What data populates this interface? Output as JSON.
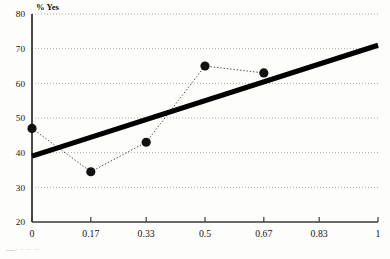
{
  "chart_data": {
    "type": "line",
    "title": "",
    "subtitle": "",
    "xlabel": "",
    "ylabel": "% Yes",
    "x": [
      0,
      0.17,
      0.33,
      0.5,
      0.67
    ],
    "values": [
      47,
      34.5,
      43,
      65,
      63
    ],
    "series": [
      {
        "name": "% Yes observed",
        "x": [
          0,
          0.17,
          0.33,
          0.5,
          0.67
        ],
        "values": [
          47,
          34.5,
          43,
          65,
          63
        ],
        "marker": "filled-circle",
        "line_style": "dotted",
        "color": "#111111"
      },
      {
        "name": "trend line",
        "x": [
          0,
          1
        ],
        "values": [
          39,
          71
        ],
        "marker": "none",
        "line_style": "solid-thick",
        "color": "#000000"
      }
    ],
    "xtick_labels": [
      "0",
      "0.17",
      "0.33",
      "0.5",
      "0.67",
      "0.83",
      "1"
    ],
    "xtick_values": [
      0,
      0.17,
      0.33,
      0.5,
      0.67,
      0.83,
      1
    ],
    "ytick_labels": [
      "20",
      "30",
      "40",
      "50",
      "60",
      "70",
      "80"
    ],
    "ytick_values": [
      20,
      30,
      40,
      50,
      60,
      70,
      80
    ],
    "xlim": [
      0,
      1
    ],
    "ylim": [
      20,
      80
    ],
    "grid": "horizontal-dotted",
    "legend": "none",
    "legend_position": "none"
  },
  "footer": {
    "cutoff_text": "—·               ·       ·· ··"
  },
  "colors": {
    "background": "#fdfdfb",
    "axis": "#2a2a2a",
    "grid": "#8d8d8d",
    "marker": "#111111",
    "trend": "#000000"
  }
}
